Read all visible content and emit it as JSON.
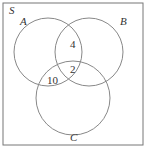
{
  "universe_label": "S",
  "sets": [
    {
      "name": "A"
    },
    {
      "name": "B"
    },
    {
      "name": "C"
    }
  ],
  "regions": {
    "A_and_B_only": "4",
    "A_and_B_and_C": "2",
    "A_and_C_only": "10"
  },
  "colors": {
    "stroke": "#777777",
    "text": "#333333"
  }
}
